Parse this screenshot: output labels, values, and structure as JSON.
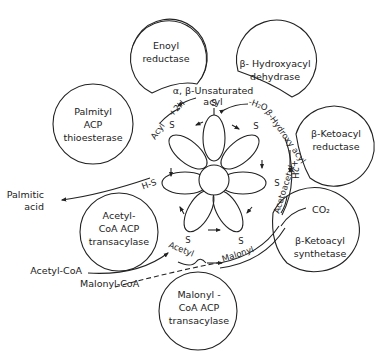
{
  "enzymes": {
    "enoyl_reductase": [
      "Enoyl",
      "reductase"
    ],
    "hydroxyacyl_dehydrase": [
      "β- Hydroxyacyl",
      "dehydrase"
    ],
    "palmityl_thioesterase": [
      "Palmityl",
      "ACP",
      "thioesterase"
    ],
    "ketoacyl_reductase": [
      "β-Ketoacyl",
      "reductase"
    ],
    "acetyl_transacylase": [
      "Acetyl-",
      "CoA ACP",
      "transacylase"
    ],
    "ketoacyl_synthetase": [
      "β-Ketoacyl",
      "synthetase"
    ],
    "malonyl_transacylase": [
      "Malonyl -",
      "CoA ACP",
      "transacylase"
    ]
  },
  "intermediates": {
    "unsaturated_acyl_1": "α, β-Unsaturated",
    "unsaturated_acyl_2": "acyl",
    "hydroxy_acyl": "β-Hydroxy acyl",
    "acetoacetyl": "Acetoacetyl",
    "malonyl": "Malonyl",
    "acetyl": "Acetyl",
    "acyl": "Acyl"
  },
  "reactants": {
    "minus_h2o": "-H₂O",
    "plus_2h_left": "+2H",
    "plus_2h_right": "+2H",
    "co2": "CO₂",
    "acetyl_coa": "Acetyl-CoA",
    "malonyl_coa": "Malonyl-CoA",
    "palmitic_1": "Palmitic",
    "palmitic_2": "acid"
  },
  "sulfur_label": "S",
  "sh_label": "H-S"
}
